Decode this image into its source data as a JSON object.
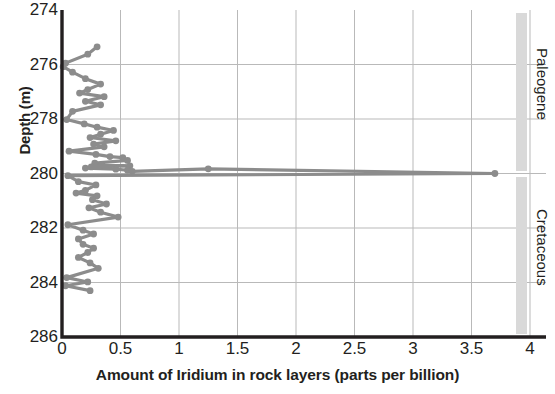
{
  "chart_data": {
    "type": "line",
    "title": "",
    "xlabel": "Amount of Iridium in rock layers (parts per billion)",
    "ylabel": "Depth (m)",
    "xlim": [
      0,
      4
    ],
    "ylim": [
      286,
      274
    ],
    "y_inverted": true,
    "grid": true,
    "legend": "none",
    "xticks": [
      "0",
      "0.5",
      "1",
      "1.5",
      "2",
      "2.5",
      "3",
      "3.5",
      "4"
    ],
    "xtick_values": [
      0,
      0.5,
      1,
      1.5,
      2,
      2.5,
      3,
      3.5,
      4
    ],
    "yticks": [
      "274",
      "276",
      "278",
      "280",
      "282",
      "284",
      "286"
    ],
    "ytick_values": [
      274,
      276,
      278,
      280,
      282,
      284,
      286
    ],
    "series": [
      {
        "name": "Iridium concentration",
        "marker": "circle",
        "color": "#8c8c8c",
        "x": [
          0.3,
          0.22,
          0.03,
          0.01,
          0.09,
          0.2,
          0.33,
          0.22,
          0.15,
          0.36,
          0.2,
          0.33,
          0.09,
          0.04,
          0.19,
          0.3,
          0.44,
          0.33,
          0.24,
          0.46,
          0.27,
          0.36,
          0.06,
          0.29,
          0.41,
          0.52,
          0.56,
          0.28,
          0.34,
          0.58,
          0.25,
          0.2,
          0.46,
          0.56,
          0.6,
          1.25,
          3.7,
          0.05,
          0.14,
          0.29,
          0.2,
          0.12,
          0.3,
          0.26,
          0.38,
          0.23,
          0.33,
          0.48,
          0.05,
          0.18,
          0.27,
          0.14,
          0.18,
          0.27,
          0.22,
          0.14,
          0.24,
          0.31,
          0.04,
          0.22,
          0.03,
          0.24
        ],
        "y": [
          275.35,
          275.62,
          275.95,
          276.08,
          276.28,
          276.52,
          276.72,
          276.92,
          277.05,
          277.18,
          277.35,
          277.48,
          277.72,
          278.02,
          278.18,
          278.3,
          278.42,
          278.56,
          278.68,
          278.8,
          278.92,
          279.02,
          279.18,
          279.3,
          279.38,
          279.42,
          279.52,
          279.62,
          279.68,
          279.72,
          279.76,
          279.8,
          279.84,
          279.88,
          279.92,
          279.83,
          280.0,
          280.08,
          280.3,
          280.42,
          280.62,
          280.72,
          280.82,
          280.96,
          281.12,
          281.26,
          281.42,
          281.6,
          281.88,
          282.08,
          282.22,
          282.4,
          282.6,
          282.74,
          282.9,
          283.08,
          283.28,
          283.48,
          283.82,
          283.98,
          284.12,
          284.3
        ]
      }
    ],
    "era_bands": [
      {
        "name": "Paleogene",
        "depth_top": 274.1,
        "depth_bottom": 279.92,
        "color": "#d9d9d9"
      },
      {
        "name": "Cretaceous",
        "depth_top": 280.12,
        "depth_bottom": 285.9,
        "color": "#d9d9d9"
      }
    ],
    "axis_color": "#231f20",
    "grid_color": "#b9b9b9"
  }
}
